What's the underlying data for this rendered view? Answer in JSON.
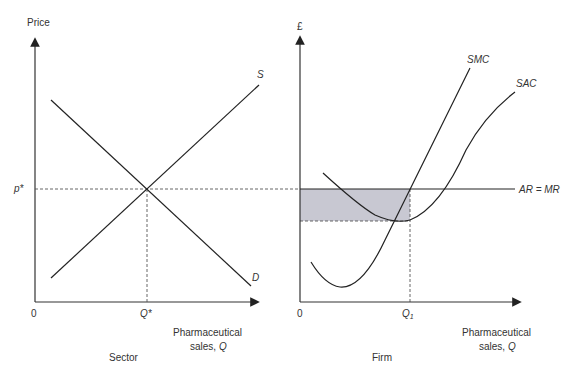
{
  "left_panel": {
    "caption": "Sector",
    "y_axis_label": "Price",
    "x_axis_label_line1": "Pharmaceutical",
    "x_axis_label_line2": "sales, ",
    "x_axis_label_var": "Q",
    "origin_label": "0",
    "price_label": "p*",
    "quantity_label": "Q*",
    "supply_label": "S",
    "demand_label": "D"
  },
  "right_panel": {
    "caption": "Firm",
    "y_axis_label": "£",
    "x_axis_label_line1": "Pharmaceutical",
    "x_axis_label_line2": "sales, ",
    "x_axis_label_var": "Q",
    "origin_label": "0",
    "quantity_label": "Q",
    "quantity_subscript": "1",
    "smc_label": "SMC",
    "sac_label": "SAC",
    "revenue_label": "AR = MR",
    "shaded_area": "supernormal profit",
    "shade_color": "#c8c8d2"
  }
}
